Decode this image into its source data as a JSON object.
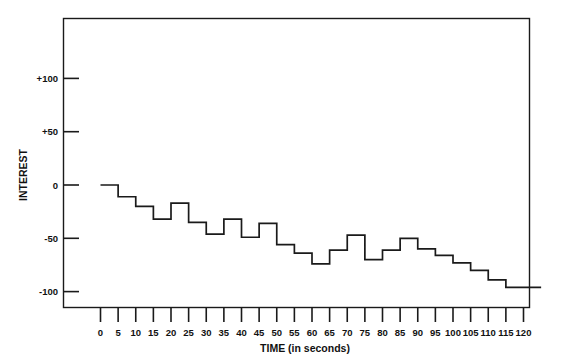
{
  "chart_data": {
    "type": "line",
    "subtype": "step",
    "title": "",
    "xlabel": "TIME (in seconds)",
    "ylabel": "INTEREST",
    "xlim": [
      0,
      120
    ],
    "ylim": [
      -130,
      130
    ],
    "grid": false,
    "legend": null,
    "x_tick_labels": [
      "0",
      "5",
      "10",
      "15",
      "20",
      "25",
      "30",
      "35",
      "40",
      "45",
      "50",
      "55",
      "60",
      "65",
      "70",
      "75",
      "80",
      "85",
      "90",
      "95",
      "100",
      "105",
      "110",
      "115",
      "120"
    ],
    "x_ticks": [
      0,
      5,
      10,
      15,
      20,
      25,
      30,
      35,
      40,
      45,
      50,
      55,
      60,
      65,
      70,
      75,
      80,
      85,
      90,
      95,
      100,
      105,
      110,
      115,
      120
    ],
    "y_tick_labels": [
      "+100",
      "+50",
      "0",
      "-50",
      "-100"
    ],
    "y_ticks": [
      100,
      50,
      0,
      -50,
      -100
    ],
    "x": [
      0,
      5,
      10,
      15,
      20,
      25,
      30,
      35,
      40,
      45,
      50,
      55,
      60,
      65,
      70,
      75,
      80,
      85,
      90,
      95,
      100,
      105,
      110,
      115,
      120
    ],
    "values": [
      0,
      -11,
      -20,
      -32,
      -17,
      -35,
      -46,
      -32,
      -49,
      -36,
      -56,
      -64,
      -74,
      -61,
      -47,
      -70,
      -61,
      -50,
      -60,
      -66,
      -73,
      -80,
      -89,
      -96,
      -96
    ],
    "series": [
      {
        "name": "INTEREST",
        "values": [
          0,
          -11,
          -20,
          -32,
          -17,
          -35,
          -46,
          -32,
          -49,
          -36,
          -56,
          -64,
          -74,
          -61,
          -47,
          -70,
          -61,
          -50,
          -60,
          -66,
          -73,
          -80,
          -89,
          -96,
          -96
        ]
      }
    ],
    "line_color": "#1a1a1a"
  },
  "axes": {
    "x_title": "TIME (in seconds)",
    "y_title": "INTEREST"
  }
}
